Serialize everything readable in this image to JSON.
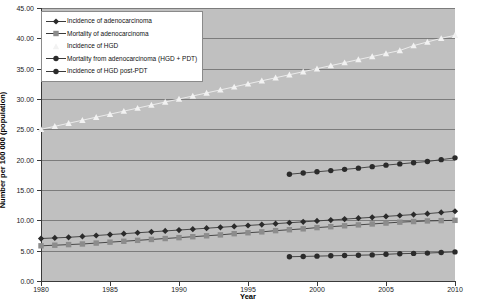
{
  "chart_data": {
    "type": "line",
    "title": "",
    "xlabel": "Year",
    "ylabel": "Number per 100 000 (population)",
    "xlim": [
      1980,
      2010
    ],
    "ylim": [
      0,
      45
    ],
    "ytick_step": 5,
    "xtick_step": 5,
    "grid": true,
    "legend_position": "top-left",
    "ytick_labels": [
      "0.00",
      "5.00",
      "10.00",
      "15.00",
      "20.00",
      "25.00",
      "30.00",
      "35.00",
      "40.00",
      "45.00"
    ],
    "xtick_labels": [
      "1980",
      "1985",
      "1990",
      "1995",
      "2000",
      "2005",
      "2010"
    ],
    "series": [
      {
        "name": "Incidence of adenocarcinoma",
        "marker": "diamond",
        "color": "#2b2b2b",
        "x": [
          1980,
          1981,
          1982,
          1983,
          1984,
          1985,
          1986,
          1987,
          1988,
          1989,
          1990,
          1991,
          1992,
          1993,
          1994,
          1995,
          1996,
          1997,
          1998,
          1999,
          2000,
          2001,
          2002,
          2003,
          2004,
          2005,
          2006,
          2007,
          2008,
          2009,
          2010
        ],
        "values": [
          7.0,
          7.1,
          7.2,
          7.35,
          7.5,
          7.65,
          7.8,
          7.95,
          8.1,
          8.25,
          8.4,
          8.55,
          8.7,
          8.85,
          9.0,
          9.15,
          9.3,
          9.45,
          9.6,
          9.75,
          9.9,
          10.05,
          10.2,
          10.35,
          10.5,
          10.65,
          10.8,
          10.95,
          11.1,
          11.3,
          11.5
        ]
      },
      {
        "name": "Mortality of adenocarcinoma",
        "marker": "square",
        "color": "#8c8c8c",
        "x": [
          1980,
          1981,
          1982,
          1983,
          1984,
          1985,
          1986,
          1987,
          1988,
          1989,
          1990,
          1991,
          1992,
          1993,
          1994,
          1995,
          1996,
          1997,
          1998,
          1999,
          2000,
          2001,
          2002,
          2003,
          2004,
          2005,
          2006,
          2007,
          2008,
          2009,
          2010
        ],
        "values": [
          5.8,
          5.9,
          6.0,
          6.1,
          6.25,
          6.4,
          6.55,
          6.7,
          6.85,
          7.0,
          7.15,
          7.3,
          7.45,
          7.6,
          7.8,
          7.95,
          8.1,
          8.3,
          8.45,
          8.6,
          8.8,
          8.95,
          9.1,
          9.25,
          9.4,
          9.55,
          9.7,
          9.8,
          9.9,
          9.95,
          10.0
        ]
      },
      {
        "name": "Incidence of HGD",
        "marker": "triangle",
        "color": "#f2f2f2",
        "x": [
          1980,
          1981,
          1982,
          1983,
          1984,
          1985,
          1986,
          1987,
          1988,
          1989,
          1990,
          1991,
          1992,
          1993,
          1994,
          1995,
          1996,
          1997,
          1998,
          1999,
          2000,
          2001,
          2002,
          2003,
          2004,
          2005,
          2006,
          2007,
          2008,
          2009,
          2010
        ],
        "values": [
          25.0,
          25.5,
          26.0,
          26.5,
          27.0,
          27.5,
          28.0,
          28.5,
          29.0,
          29.5,
          30.0,
          30.5,
          31.0,
          31.5,
          32.0,
          32.5,
          33.0,
          33.5,
          34.0,
          34.5,
          35.0,
          35.5,
          36.0,
          36.5,
          37.0,
          37.5,
          38.0,
          38.8,
          39.4,
          40.0,
          40.5
        ]
      },
      {
        "name": "Mortality from adenocarcinoma (HGD + PDT)",
        "marker": "circle",
        "color": "#2b2b2b",
        "x": [
          1998,
          1999,
          2000,
          2001,
          2002,
          2003,
          2004,
          2005,
          2006,
          2007,
          2008,
          2009,
          2010
        ],
        "values": [
          17.6,
          17.8,
          18.0,
          18.2,
          18.4,
          18.6,
          18.85,
          19.1,
          19.3,
          19.5,
          19.7,
          20.0,
          20.3
        ]
      },
      {
        "name": "Incidence of HGD post-PDT",
        "marker": "circle",
        "color": "#2b2b2b",
        "x": [
          1998,
          1999,
          2000,
          2001,
          2002,
          2003,
          2004,
          2005,
          2006,
          2007,
          2008,
          2009,
          2010
        ],
        "values": [
          4.0,
          4.05,
          4.1,
          4.15,
          4.2,
          4.25,
          4.3,
          4.4,
          4.5,
          4.55,
          4.6,
          4.7,
          4.8
        ]
      }
    ]
  }
}
